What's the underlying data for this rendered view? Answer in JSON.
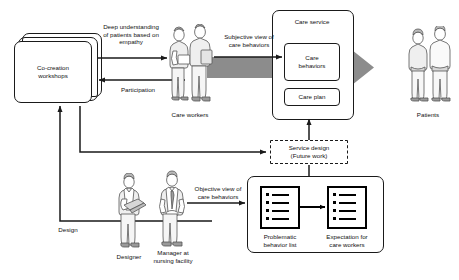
{
  "diagram": {
    "nodes": {
      "workshops": "Co-creation\nworkshops",
      "care_service": "Care service",
      "care_behaviors": "Care\nbehaviors",
      "care_plan": "Care plan",
      "service_design": "Service design\n(Future work)",
      "problematic_list": "Problematic\nbehavior list",
      "expectation_list": "Expectation for\ncare workers"
    },
    "edge_labels": {
      "deep_understanding": "Deep understanding\nof patients based on\nempathy",
      "participation": "Participation",
      "subjective_view": "Subjective view of\ncare behaviors",
      "objective_view": "Objective view of\ncare behaviors",
      "design": "Design"
    },
    "actor_labels": {
      "care_workers": "Care workers",
      "patients": "Patients",
      "designer": "Designer",
      "manager": "Manager at\nnursing facility"
    },
    "colors": {
      "line": "#1a1a1a",
      "flow_arrow": "#8c8c8c",
      "list_border": "#000000",
      "background": "#ffffff"
    },
    "list_rows": 4
  }
}
